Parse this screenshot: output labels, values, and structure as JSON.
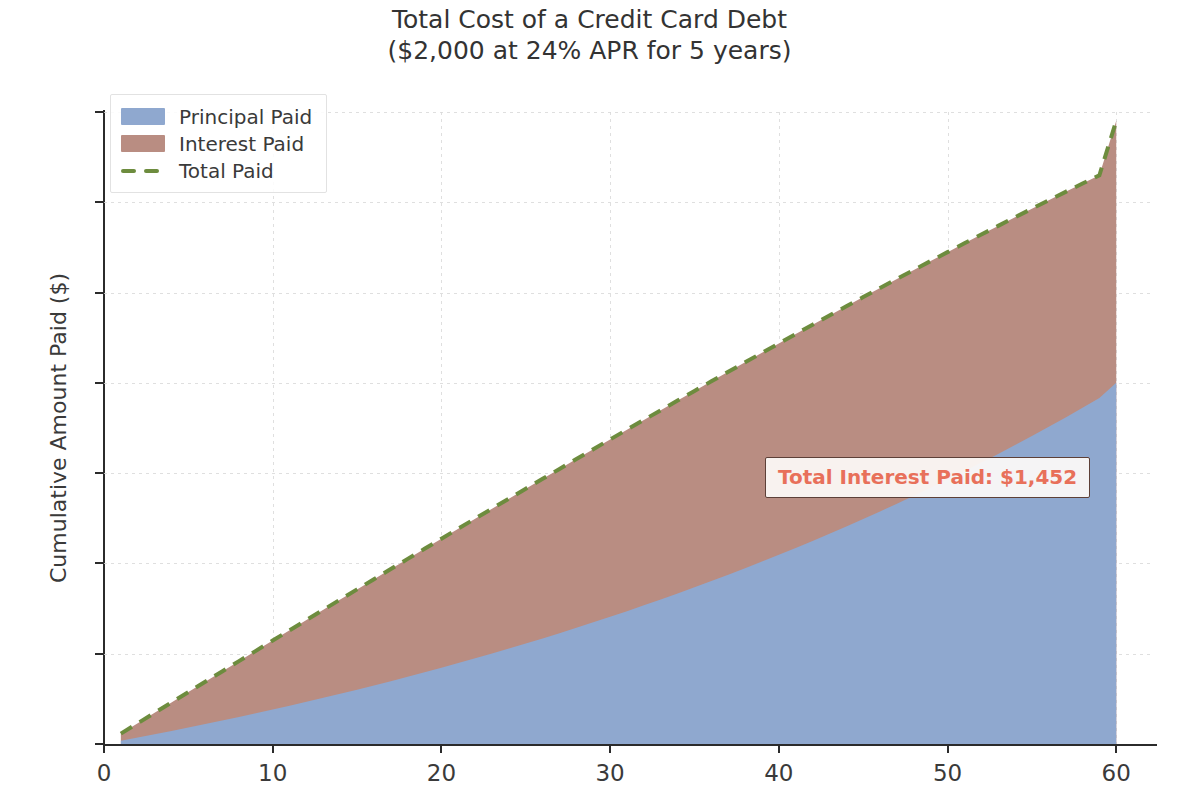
{
  "title": {
    "line1": "Total Cost of a Credit Card Debt",
    "line2": "($2,000 at 24% APR for 5 years)"
  },
  "axes": {
    "xlabel": "Months",
    "ylabel": "Cumulative Amount Paid ($)",
    "xticks": [
      "0",
      "10",
      "20",
      "30",
      "40",
      "50",
      "60"
    ],
    "yticks": [
      "0",
      "500",
      "1000",
      "1500",
      "2000",
      "2500",
      "3000",
      "3500"
    ]
  },
  "legend": {
    "items": [
      {
        "label": "Principal Paid",
        "color": "#8fa8cf",
        "style": "area"
      },
      {
        "label": "Interest Paid",
        "color": "#b98d82",
        "style": "area"
      },
      {
        "label": "Total Paid",
        "color": "#6d8c3e",
        "style": "dashed-line"
      }
    ]
  },
  "annotation": {
    "text": "Total Interest Paid: $1,452",
    "text_color": "#e8705a",
    "border_color": "#5d4038",
    "face_color": "#fdfaf8"
  },
  "colors": {
    "principal": "#8fa8cf",
    "interest": "#b98d82",
    "total_line": "#6d8c3e",
    "grid": "#d9d9d9",
    "spine": "#2b2b2b",
    "text": "#3a3a3a",
    "background": "#ffffff"
  },
  "chart_data": {
    "type": "area",
    "title": "Total Cost of a Credit Card Debt ($2,000 at 24% APR for 5 years)",
    "xlabel": "Months",
    "ylabel": "Cumulative Amount Paid ($)",
    "xlim": [
      0,
      62
    ],
    "ylim": [
      0,
      3500
    ],
    "grid": true,
    "stacked": true,
    "legend_position": "upper left",
    "x": [
      1,
      2,
      3,
      4,
      5,
      6,
      7,
      8,
      9,
      10,
      11,
      12,
      13,
      14,
      15,
      16,
      17,
      18,
      19,
      20,
      21,
      22,
      23,
      24,
      25,
      26,
      27,
      28,
      29,
      30,
      31,
      32,
      33,
      34,
      35,
      36,
      37,
      38,
      39,
      40,
      41,
      42,
      43,
      44,
      45,
      46,
      47,
      48,
      49,
      50,
      51,
      52,
      53,
      54,
      55,
      56,
      57,
      58,
      59,
      60
    ],
    "series": [
      {
        "name": "Principal Paid",
        "color": "#8fa8cf",
        "values": [
          17.5,
          35.4,
          53.6,
          72.1,
          91.0,
          110.3,
          129.9,
          149.9,
          170.2,
          191.0,
          212.2,
          233.8,
          255.8,
          278.2,
          301.1,
          324.4,
          348.2,
          372.5,
          397.3,
          422.5,
          448.3,
          474.5,
          501.3,
          528.6,
          556.5,
          584.9,
          613.9,
          643.5,
          673.6,
          704.4,
          735.8,
          767.8,
          800.4,
          833.7,
          867.6,
          902.3,
          937.6,
          973.6,
          1010.3,
          1047.7,
          1085.9,
          1124.8,
          1164.4,
          1204.9,
          1246.1,
          1288.1,
          1331.0,
          1374.7,
          1419.3,
          1464.7,
          1511.0,
          1558.3,
          1606.4,
          1655.5,
          1705.6,
          1756.6,
          1808.7,
          1861.8,
          1915.9,
          2000.0
        ]
      },
      {
        "name": "Interest Paid",
        "color": "#b98d82",
        "values": [
          40.0,
          79.6,
          118.9,
          157.8,
          196.3,
          234.3,
          271.9,
          309.0,
          345.7,
          381.9,
          417.6,
          452.8,
          487.5,
          521.6,
          555.2,
          588.2,
          620.7,
          652.5,
          683.7,
          714.3,
          744.3,
          773.6,
          802.2,
          830.1,
          857.3,
          883.8,
          909.6,
          934.6,
          958.9,
          982.4,
          1005.1,
          1027.0,
          1048.0,
          1068.2,
          1087.6,
          1106.0,
          1123.6,
          1140.2,
          1155.9,
          1170.6,
          1184.3,
          1197.0,
          1208.7,
          1219.3,
          1228.8,
          1237.2,
          1244.5,
          1250.6,
          1255.5,
          1259.2,
          1261.7,
          1262.9,
          1262.8,
          1261.4,
          1258.7,
          1254.6,
          1249.1,
          1242.2,
          1233.9,
          1452.0
        ]
      },
      {
        "name": "Total Paid",
        "color": "#6d8c3e",
        "style": "dashed",
        "values": [
          57.5,
          115.1,
          172.6,
          230.1,
          287.6,
          345.2,
          402.7,
          460.2,
          517.8,
          575.3,
          632.8,
          690.3,
          747.9,
          805.4,
          862.9,
          920.4,
          978.0,
          1035.5,
          1093.0,
          1150.6,
          1208.1,
          1265.6,
          1323.1,
          1380.7,
          1438.2,
          1495.7,
          1553.2,
          1610.8,
          1668.3,
          1755.8,
          1813.4,
          1870.9,
          1898.4,
          1955.9,
          2013.5,
          2071.0,
          2128.5,
          2186.0,
          2243.6,
          2301.1,
          2358.6,
          2416.1,
          2473.7,
          2551.2,
          2608.7,
          2666.2,
          2723.8,
          2781.3,
          2838.8,
          2896.3,
          2953.9,
          3011.4,
          3068.9,
          3126.5,
          3186.0,
          3243.5,
          3300.0,
          3357.6,
          3415.1,
          3452.0
        ]
      }
    ],
    "annotations": [
      {
        "text": "Total Interest Paid: $1,452",
        "x": 38,
        "y": 1560
      }
    ],
    "summary": {
      "loan_principal": 2000,
      "apr_percent": 24,
      "term_years": 5,
      "term_months": 60,
      "monthly_payment": 57.53,
      "total_paid": 3452,
      "total_interest": 1452
    }
  }
}
